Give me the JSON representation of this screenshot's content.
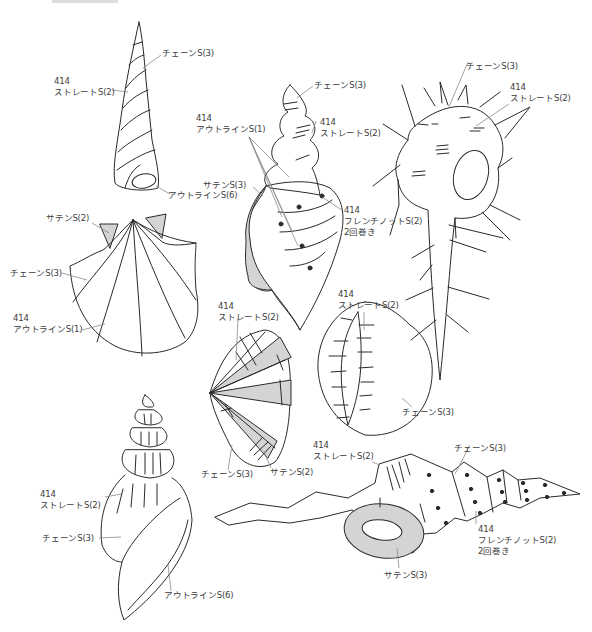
{
  "page": {
    "top_cut_text": "────────────"
  },
  "stitch_labels": {
    "tower_chain": "チェーンS(3)",
    "tower_straight_num": "414",
    "tower_straight": "ストレートS(2)",
    "tower_outline": "アウトラインS(6)",
    "scallop_satin": "サテンS(2)",
    "scallop_chain": "チェーンS(3)",
    "scallop_outline_num": "414",
    "scallop_outline": "アウトラインS(1)",
    "conch_chain": "チェーンS(3)",
    "conch_outline_num": "414",
    "conch_outline": "アウトラインS(1)",
    "conch_straight_num": "414",
    "conch_straight": "ストレートS(2)",
    "conch_satin": "サテンS(3)",
    "conch_french_num": "414",
    "conch_french": "フレンチノットS(2)",
    "conch_french_note": "2回巻き",
    "murex_chain": "チェーンS(3)",
    "murex_straight_num": "414",
    "murex_straight": "ストレートS(2)",
    "fan_straight_num": "414",
    "fan_straight": "ストレートS(2)",
    "fan_chain": "チェーンS(3)",
    "fan_satin": "サテンS(2)",
    "cowrie_straight_num": "414",
    "cowrie_straight": "ストレートS(2)",
    "cowrie_chain": "チェーンS(3)",
    "whelk_straight_num": "414",
    "whelk_straight": "ストレートS(2)",
    "whelk_chain": "チェーンS(3)",
    "whelk_outline": "アウトラインS(6)",
    "auger_straight_num": "414",
    "auger_straight": "ストレートS(2)",
    "auger_chain": "チェーンS(3)",
    "auger_french_num": "414",
    "auger_french": "フレンチノットS(2)",
    "auger_french_note": "2回巻き",
    "auger_satin": "サテンS(3)"
  },
  "colors": {
    "line": "#2a2a2a",
    "leader": "#8a8a8a",
    "fill_satin": "#d4d4d4",
    "background": "#ffffff"
  }
}
